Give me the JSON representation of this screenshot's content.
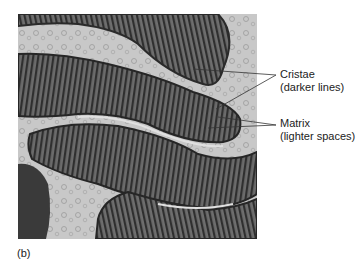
{
  "figure": {
    "panel_label": "(b)",
    "image_description": "electron-micrograph-of-mitochondria",
    "labels": [
      {
        "title": "Cristae",
        "subtitle": "(darker lines)"
      },
      {
        "title": "Matrix",
        "subtitle": "(lighter spaces)"
      }
    ],
    "colors": {
      "background": "#ffffff",
      "cytoplasm": "#c9c9c9",
      "mitochondrion": "#5a5a5a",
      "cristae": "#2e2e2e",
      "leader_line": "#333333",
      "text": "#222222"
    }
  }
}
